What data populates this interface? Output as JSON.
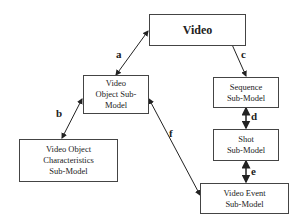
{
  "nodes": {
    "video": "Video",
    "video_object": "Video\nObject Sub-\nModel",
    "sequence": "Sequence\nSub-Model",
    "shot": "Shot\nSub-Model",
    "video_object_characteristics": "Video Object\nCharacteristics\nSub-Model",
    "video_event": "Video Event\nSub-Model"
  },
  "edges": {
    "a": "a",
    "b": "b",
    "c": "c",
    "d": "d",
    "e": "e",
    "f": "f"
  }
}
